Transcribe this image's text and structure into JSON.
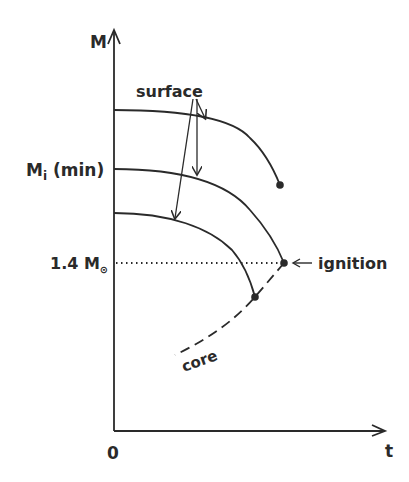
{
  "diagram": {
    "axes": {
      "y_label": "M",
      "x_label": "t",
      "origin_label": "0"
    },
    "y_ticks": {
      "mi_min": {
        "main": "M",
        "sub": "i",
        "suffix": " (min)"
      },
      "chandrasekhar": {
        "prefix": "1.4 M",
        "symbol": "⊙"
      }
    },
    "labels": {
      "surface": "surface",
      "core": "core",
      "ignition": "ignition"
    },
    "curves": [
      {
        "name": "surface-top",
        "start": [
          114,
          110
        ],
        "end": [
          280,
          185
        ]
      },
      {
        "name": "surface-middle",
        "start": [
          114,
          169
        ],
        "end": [
          284,
          263
        ]
      },
      {
        "name": "surface-bottom",
        "start": [
          114,
          213
        ],
        "end": [
          255,
          297
        ]
      }
    ],
    "core_line": {
      "start": [
        175,
        355
      ],
      "end": [
        284,
        263
      ],
      "style": "dashed"
    },
    "threshold_line": {
      "y": 263,
      "style": "dotted",
      "label": "1.4 M⊙"
    },
    "colors": {
      "ink": "#2a2a2a",
      "background": "#ffffff"
    }
  }
}
